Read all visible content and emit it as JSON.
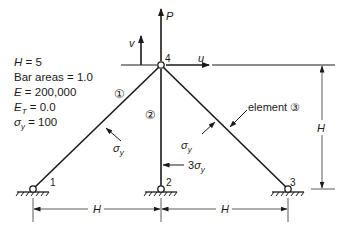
{
  "parameters": [
    {
      "symbol": "H",
      "text": " = 5"
    },
    {
      "symbol": "",
      "text": "Bar areas = 1.0"
    },
    {
      "symbol": "E",
      "text": " = 200,000"
    },
    {
      "symbol": "E",
      "sub": "T",
      "text": " = 0.0"
    },
    {
      "symbol": "σ",
      "sub": "y",
      "text": " = 100"
    }
  ],
  "nodes": [
    {
      "id": "1",
      "label": "1"
    },
    {
      "id": "2",
      "label": "2"
    },
    {
      "id": "3",
      "label": "3"
    },
    {
      "id": "4",
      "label": "4"
    }
  ],
  "elements": [
    {
      "id": "1",
      "label": "①"
    },
    {
      "id": "2",
      "label": "②"
    },
    {
      "id": "3",
      "label": "③",
      "callout": "element ③"
    }
  ],
  "loads": {
    "force": "P",
    "disp_u": "u",
    "disp_v": "v"
  },
  "stresses": {
    "left": {
      "sym": "σ",
      "sub": "y"
    },
    "right": {
      "sym": "σ",
      "sub": "y"
    },
    "center": {
      "coef": "3",
      "sym": "σ",
      "sub": "y"
    }
  },
  "dimensions": {
    "left_span": "H",
    "right_span": "H",
    "height": "H"
  },
  "colors": {
    "line": "#1a1a1a",
    "dim_line": "#333333"
  }
}
